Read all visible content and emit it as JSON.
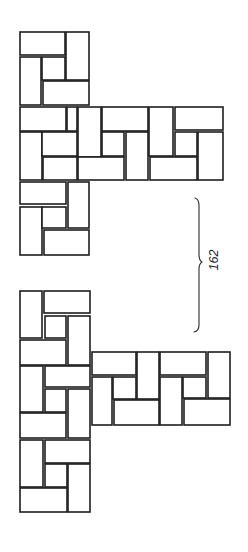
{
  "figure": {
    "background": "#ffffff",
    "line_color": "#1e1e1e",
    "reference_label": "162",
    "reference_label_orientation": "rotated -90deg (reads bottom-to-top)",
    "bracket": {
      "description": "curly brace spanning vertical gap between the two paver groups",
      "path": "M195,198 Q199,199 199,206 L199,255 Q199,260 202,262 Q199,264 199,269 L199,325 Q199,331 194,332"
    },
    "groups": [
      {
        "name": "top-paver-assembly",
        "description": "T-shaped arrangement: vertical stem of 2 pinwheel blocks with a horizontal band of bricks extending right",
        "bricks": [
          [
            20,
            32,
            45,
            23
          ],
          [
            66,
            32,
            23,
            48
          ],
          [
            20,
            57,
            21,
            48
          ],
          [
            42,
            57,
            23,
            23
          ],
          [
            43,
            81,
            46,
            24
          ],
          [
            20,
            107,
            46,
            24
          ],
          [
            67,
            107,
            10,
            24
          ],
          [
            78,
            107,
            23,
            50
          ],
          [
            20,
            132,
            22,
            48
          ],
          [
            42,
            132,
            35,
            24
          ],
          [
            43,
            157,
            34,
            23
          ],
          [
            78,
            157,
            46,
            23
          ],
          [
            102,
            107,
            46,
            24
          ],
          [
            102,
            132,
            22,
            24
          ],
          [
            126,
            132,
            22,
            48
          ],
          [
            149,
            107,
            24,
            49
          ],
          [
            175,
            107,
            48,
            23
          ],
          [
            175,
            132,
            22,
            24
          ],
          [
            198,
            132,
            25,
            48
          ],
          [
            150,
            157,
            47,
            23
          ],
          [
            20,
            182,
            46,
            22
          ],
          [
            68,
            182,
            21,
            46
          ],
          [
            20,
            207,
            22,
            48
          ],
          [
            42,
            207,
            24,
            21
          ],
          [
            44,
            230,
            45,
            25
          ]
        ]
      },
      {
        "name": "bottom-paver-assembly",
        "description": "T-shaped arrangement: vertical stem of 3 pinwheel blocks with 2 pinwheel blocks extending right from the middle",
        "bricks": [
          [
            20,
            291,
            22,
            47
          ],
          [
            44,
            291,
            46,
            22
          ],
          [
            45,
            316,
            21,
            22
          ],
          [
            68,
            316,
            22,
            49
          ],
          [
            20,
            340,
            46,
            25
          ],
          [
            20,
            366,
            23,
            46
          ],
          [
            45,
            366,
            45,
            21
          ],
          [
            45,
            389,
            21,
            23
          ],
          [
            68,
            389,
            22,
            49
          ],
          [
            20,
            413,
            46,
            25
          ],
          [
            20,
            440,
            23,
            47
          ],
          [
            45,
            440,
            45,
            23
          ],
          [
            45,
            464,
            22,
            23
          ],
          [
            68,
            464,
            22,
            48
          ],
          [
            20,
            488,
            47,
            24
          ],
          [
            92,
            352,
            44,
            23
          ],
          [
            137,
            352,
            22,
            47
          ],
          [
            92,
            377,
            20,
            48
          ],
          [
            113,
            377,
            23,
            22
          ],
          [
            114,
            400,
            45,
            25
          ],
          [
            160,
            352,
            46,
            23
          ],
          [
            208,
            352,
            22,
            46
          ],
          [
            160,
            377,
            22,
            48
          ],
          [
            183,
            377,
            23,
            21
          ],
          [
            184,
            399,
            46,
            26
          ]
        ]
      }
    ]
  }
}
